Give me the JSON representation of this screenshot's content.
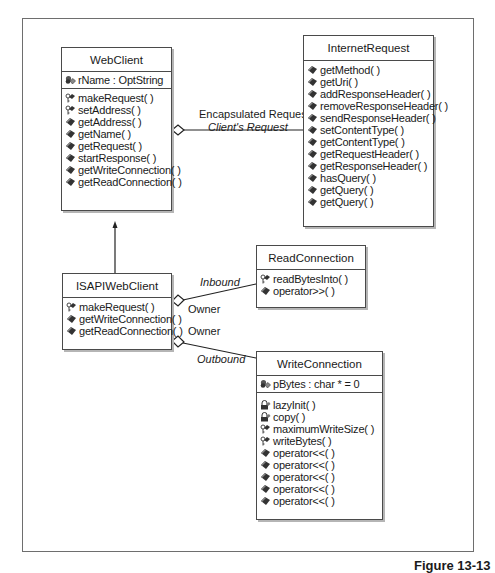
{
  "caption": "Figure 13-13",
  "classes": {
    "webclient": {
      "name": "WebClient",
      "attributes": [
        {
          "icon": "private-attribute-icon",
          "text": "rName : OptString"
        }
      ],
      "operations": [
        {
          "icon": "protected-operation-icon",
          "text": "makeRequest( )"
        },
        {
          "icon": "protected-operation-icon",
          "text": "setAddress( )"
        },
        {
          "icon": "public-operation-icon",
          "text": "getAddress( )"
        },
        {
          "icon": "public-operation-icon",
          "text": "getName( )"
        },
        {
          "icon": "public-operation-icon",
          "text": "getRequest( )"
        },
        {
          "icon": "public-operation-icon",
          "text": "startResponse( )"
        },
        {
          "icon": "public-operation-icon",
          "text": "getWriteConnection( )"
        },
        {
          "icon": "public-operation-icon",
          "text": "getReadConnection( )"
        }
      ]
    },
    "internetrequest": {
      "name": "InternetRequest",
      "operations": [
        {
          "icon": "public-operation-icon",
          "text": "getMethod( )"
        },
        {
          "icon": "public-operation-icon",
          "text": "getUri( )"
        },
        {
          "icon": "public-operation-icon",
          "text": "addResponseHeader( )"
        },
        {
          "icon": "public-operation-icon",
          "text": "removeResponseHeader( )"
        },
        {
          "icon": "public-operation-icon",
          "text": "sendResponseHeader( )"
        },
        {
          "icon": "public-operation-icon",
          "text": "setContentType( )"
        },
        {
          "icon": "public-operation-icon",
          "text": "getContentType( )"
        },
        {
          "icon": "public-operation-icon",
          "text": "getRequestHeader( )"
        },
        {
          "icon": "public-operation-icon",
          "text": "getResponseHeader( )"
        },
        {
          "icon": "public-operation-icon",
          "text": "hasQuery( )"
        },
        {
          "icon": "public-operation-icon",
          "text": "getQuery( )"
        },
        {
          "icon": "public-operation-icon",
          "text": "getQuery( )"
        }
      ]
    },
    "isapiwebclient": {
      "name": "ISAPIWebClient",
      "operations": [
        {
          "icon": "protected-operation-icon",
          "text": "makeRequest( )"
        },
        {
          "icon": "public-operation-icon",
          "text": "getWriteConnection( )"
        },
        {
          "icon": "public-operation-icon",
          "text": "getReadConnection( )"
        }
      ]
    },
    "readconnection": {
      "name": "ReadConnection",
      "operations": [
        {
          "icon": "protected-operation-icon",
          "text": "readBytesInto( )"
        },
        {
          "icon": "public-operation-icon",
          "text": "operator>>( )"
        }
      ]
    },
    "writeconnection": {
      "name": "WriteConnection",
      "attributes": [
        {
          "icon": "private-attribute-icon",
          "text": "pBytes : char * = 0"
        }
      ],
      "operations": [
        {
          "icon": "private-operation-icon",
          "text": "lazyInit( )"
        },
        {
          "icon": "private-operation-icon",
          "text": "copy( )"
        },
        {
          "icon": "protected-operation-icon",
          "text": "maximumWriteSize( )"
        },
        {
          "icon": "protected-operation-icon",
          "text": "writeBytes( )"
        },
        {
          "icon": "public-operation-icon",
          "text": "operator<<( )"
        },
        {
          "icon": "public-operation-icon",
          "text": "operator<<( )"
        },
        {
          "icon": "public-operation-icon",
          "text": "operator<<( )"
        },
        {
          "icon": "public-operation-icon",
          "text": "operator<<( )"
        },
        {
          "icon": "public-operation-icon",
          "text": "operator<<( )"
        }
      ]
    }
  },
  "associations": {
    "request": {
      "name": "Encapsulated Request",
      "role": "Client's Request"
    },
    "inbound": {
      "role": "Inbound",
      "owner": "Owner"
    },
    "outbound": {
      "role": "Outbound",
      "owner": "Owner"
    }
  }
}
